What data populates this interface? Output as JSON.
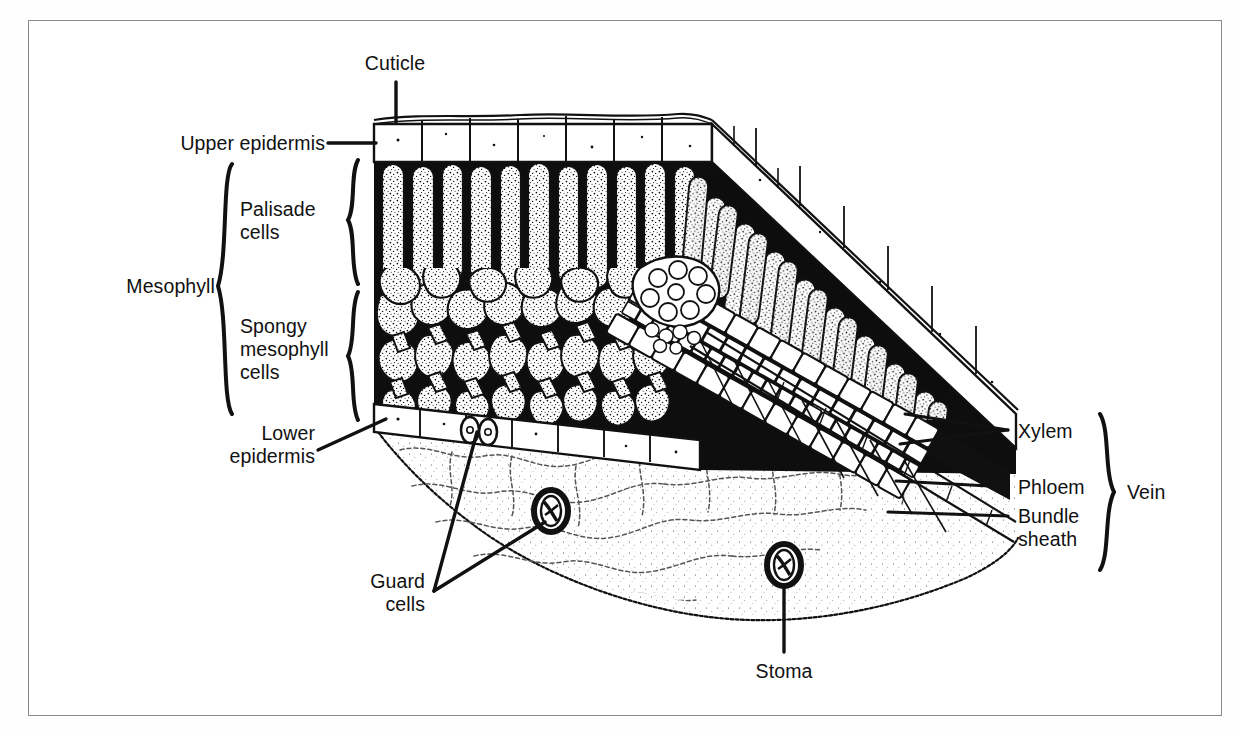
{
  "figure": {
    "type": "leaf-cross-section-diagram",
    "style": "black-and-white line drawing with stippling",
    "border_color": "#8a8a8a",
    "ink_color": "#111111",
    "background_color": "#ffffff"
  },
  "labels": {
    "cuticle": "Cuticle",
    "upper_epidermis": "Upper epidermis",
    "mesophyll": "Mesophyll",
    "palisade_cells": "Palisade\ncells",
    "spongy_mesophyll_cells": "Spongy\nmesophyll\ncells",
    "lower_epidermis": "Lower\nepidermis",
    "guard_cells": "Guard\ncells",
    "stoma": "Stoma",
    "xylem": "Xylem",
    "phloem": "Phloem",
    "bundle_sheath": "Bundle\nsheath",
    "vein": "Vein"
  },
  "structures": [
    {
      "name": "cuticle",
      "label": "Cuticle",
      "side": "top",
      "leader": "vertical-line"
    },
    {
      "name": "upper-epidermis",
      "label": "Upper epidermis",
      "side": "left",
      "leader": "horizontal-line"
    },
    {
      "name": "mesophyll",
      "label": "Mesophyll",
      "side": "left",
      "leader": "large-brace"
    },
    {
      "name": "palisade-cells",
      "label": "Palisade cells",
      "side": "left",
      "leader": "small-brace"
    },
    {
      "name": "spongy-mesophyll-cells",
      "label": "Spongy mesophyll cells",
      "side": "left",
      "leader": "small-brace"
    },
    {
      "name": "lower-epidermis",
      "label": "Lower epidermis",
      "side": "left",
      "leader": "diagonal-line"
    },
    {
      "name": "guard-cells",
      "label": "Guard cells",
      "side": "bottom-left",
      "leader": "two-diagonal-lines"
    },
    {
      "name": "stoma",
      "label": "Stoma",
      "side": "bottom",
      "leader": "vertical-line"
    },
    {
      "name": "xylem",
      "label": "Xylem",
      "side": "right",
      "leader": "two-converging-lines"
    },
    {
      "name": "phloem",
      "label": "Phloem",
      "side": "right",
      "leader": "horizontal-line"
    },
    {
      "name": "bundle-sheath",
      "label": "Bundle sheath",
      "side": "right",
      "leader": "horizontal-line"
    },
    {
      "name": "vein",
      "label": "Vein",
      "side": "right",
      "leader": "brace"
    }
  ]
}
